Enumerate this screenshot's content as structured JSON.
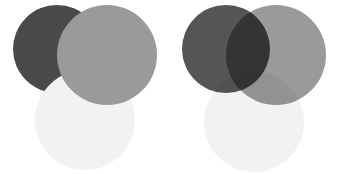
{
  "figure": {
    "background_color": "#ffffff",
    "width": 339,
    "height": 174,
    "panel_count": 2
  },
  "panels": [
    {
      "id": "normal",
      "name": "opaque-stacking-panel",
      "blend_mode": "normal",
      "origin_x": 0,
      "origin_y": 0,
      "width": 170,
      "height": 174,
      "draw_order": [
        "dark-circle",
        "light-circle",
        "gray-circle"
      ],
      "circles": [
        {
          "id": "dark-circle",
          "label": "dark gray circle",
          "color": "#4a4a4a",
          "center_x": 57,
          "center_y": 49,
          "radius": 44,
          "z_index": 1
        },
        {
          "id": "light-circle",
          "label": "near-white circle",
          "color": "#f2f2f2",
          "center_x": 85,
          "center_y": 120,
          "radius": 50,
          "z_index": 2
        },
        {
          "id": "gray-circle",
          "label": "medium gray circle",
          "color": "#9a9a9a",
          "center_x": 107,
          "center_y": 55,
          "radius": 50,
          "z_index": 3
        }
      ],
      "overlap_colors": {
        "dark_and_gray": "#9a9a9a",
        "light_and_gray": "#9a9a9a",
        "dark_and_light": "#f2f2f2",
        "all_three": "#9a9a9a"
      }
    },
    {
      "id": "multiply",
      "name": "multiply-blend-panel",
      "blend_mode": "multiply",
      "origin_x": 169,
      "origin_y": 0,
      "width": 170,
      "height": 174,
      "draw_order": [
        "dark-circle",
        "gray-circle",
        "light-circle"
      ],
      "circles": [
        {
          "id": "dark-circle",
          "label": "dark gray circle",
          "color": "#555555",
          "center_x": 57,
          "center_y": 49,
          "radius": 44,
          "z_index": 1
        },
        {
          "id": "gray-circle",
          "label": "medium gray circle",
          "color": "#9a9a9a",
          "center_x": 107,
          "center_y": 55,
          "radius": 50,
          "z_index": 2
        },
        {
          "id": "light-circle",
          "label": "near-white circle",
          "color": "#f2f2f2",
          "center_x": 85,
          "center_y": 122,
          "radius": 50,
          "z_index": 3
        }
      ],
      "overlap_colors": {
        "dark_and_gray": "#2f2f2f",
        "light_and_gray": "#929292",
        "dark_and_light": "#4f4f4f",
        "all_three": "#0a0a0a"
      }
    }
  ]
}
